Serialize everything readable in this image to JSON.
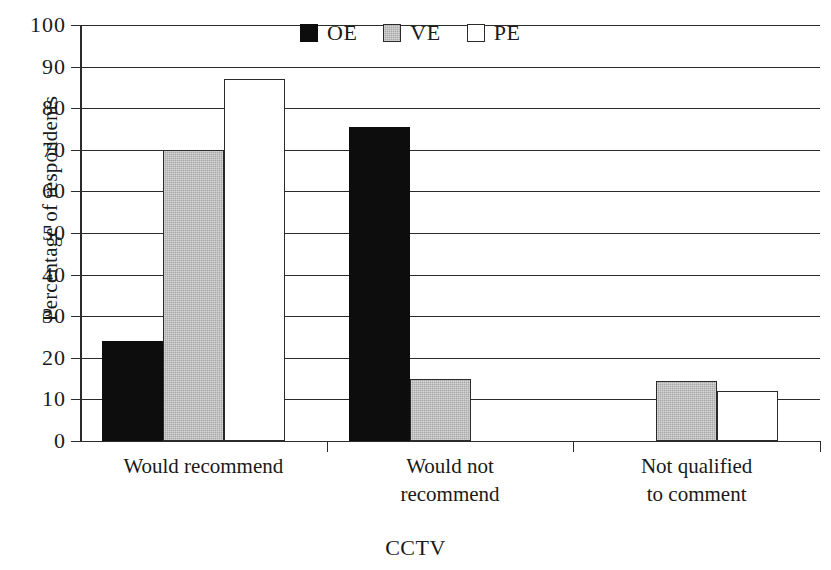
{
  "chart_data": {
    "type": "bar",
    "title": "",
    "xlabel": "CCTV",
    "ylabel": "Percentage of respondents",
    "categories": [
      "Would recommend",
      "Would not recommend",
      "Not qualified to comment"
    ],
    "series": [
      {
        "name": "OE",
        "color": "#0d0d0d",
        "fill": "black",
        "values": [
          24,
          75.5,
          0
        ]
      },
      {
        "name": "VE",
        "color": "#a8a8a8",
        "fill": "gray",
        "values": [
          70,
          15,
          14.5
        ]
      },
      {
        "name": "PE",
        "color": "#ffffff",
        "fill": "white",
        "values": [
          87,
          0,
          12
        ]
      }
    ],
    "ylim": [
      0,
      100
    ],
    "ytick_values": [
      0,
      10,
      20,
      30,
      40,
      50,
      60,
      70,
      80,
      90,
      100
    ],
    "ytick_labels": [
      "0",
      "10",
      "20",
      "30",
      "40",
      "50",
      "60",
      "70",
      "80",
      "90",
      "100"
    ],
    "grid": true,
    "grid_axis": "y",
    "legend_position": "top-center",
    "legend_entries": [
      "OE",
      "VE",
      "PE"
    ]
  },
  "legend": {
    "items": [
      {
        "label": "OE",
        "swatch": "legend-swatch-black"
      },
      {
        "label": "VE",
        "swatch": "legend-swatch-gray"
      },
      {
        "label": "PE",
        "swatch": "legend-swatch-white"
      }
    ]
  },
  "axes": {
    "y_title": "Percentage of respondents",
    "x_title": "CCTV",
    "x_categories": [
      {
        "line1": "Would recommend",
        "line2": ""
      },
      {
        "line1": "Would not",
        "line2": "recommend"
      },
      {
        "line1": "Not qualified",
        "line2": "to comment"
      }
    ]
  }
}
